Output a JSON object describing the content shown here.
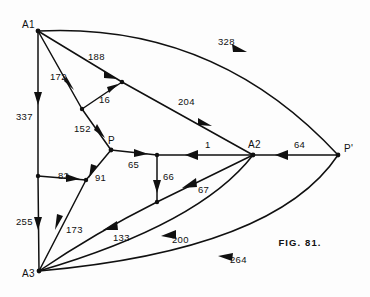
{
  "figure": {
    "caption": "FIG. 81.",
    "caption_x": 300,
    "caption_y": 246,
    "ink_color": "#101010",
    "background_color": "#fdfdfd"
  },
  "nodes": [
    {
      "id": "A1",
      "label": "A1",
      "x": 38,
      "y": 31,
      "label_x": 22,
      "label_y": 28,
      "terminal": true
    },
    {
      "id": "A2",
      "label": "A2",
      "x": 253,
      "y": 155,
      "label_x": 248,
      "label_y": 148,
      "terminal": true
    },
    {
      "id": "A3",
      "label": "A3",
      "x": 39,
      "y": 271,
      "label_x": 22,
      "label_y": 277,
      "terminal": true
    },
    {
      "id": "P",
      "label": "P",
      "x": 111,
      "y": 150,
      "label_x": 108,
      "label_y": 144,
      "terminal": true
    },
    {
      "id": "Pp",
      "label": "P'",
      "x": 338,
      "y": 155,
      "label_x": 344,
      "label_y": 152,
      "terminal": true
    },
    {
      "id": "J1",
      "label": "",
      "x": 122,
      "y": 82,
      "label_x": 0,
      "label_y": 0,
      "terminal": false
    },
    {
      "id": "J2",
      "label": "",
      "x": 82,
      "y": 109,
      "label_x": 0,
      "label_y": 0,
      "terminal": false
    },
    {
      "id": "J3",
      "label": "",
      "x": 38,
      "y": 176,
      "label_x": 0,
      "label_y": 0,
      "terminal": false
    },
    {
      "id": "J4",
      "label": "",
      "x": 86,
      "y": 180,
      "label_x": 0,
      "label_y": 0,
      "terminal": false
    },
    {
      "id": "J5",
      "label": "",
      "x": 157,
      "y": 155,
      "label_x": 0,
      "label_y": 0,
      "terminal": false
    },
    {
      "id": "J6",
      "label": "",
      "x": 157,
      "y": 202,
      "label_x": 0,
      "label_y": 0,
      "terminal": false
    }
  ],
  "edges": [
    {
      "id": "e-188",
      "label": "188",
      "from": "A1",
      "to": "J1",
      "label_x": 88,
      "label_y": 60,
      "shape": "straight"
    },
    {
      "id": "e-204",
      "label": "204",
      "from": "J1",
      "to": "A2",
      "label_x": 178,
      "label_y": 105,
      "shape": "straight"
    },
    {
      "id": "e-328",
      "label": "328",
      "from": "A1",
      "to": "Pp",
      "label_x": 218,
      "label_y": 45,
      "shape": "curve"
    },
    {
      "id": "e-172",
      "label": "172",
      "from": "A1",
      "to": "J2",
      "label_x": 50,
      "label_y": 80,
      "shape": "straight"
    },
    {
      "id": "e-16",
      "label": "16",
      "from": "J2",
      "to": "J1",
      "label_x": 99,
      "label_y": 103,
      "shape": "straight"
    },
    {
      "id": "e-152",
      "label": "152",
      "from": "J2",
      "to": "P",
      "label_x": 74,
      "label_y": 132,
      "shape": "straight"
    },
    {
      "id": "e-337",
      "label": "337",
      "from": "A1",
      "to": "J3",
      "label_x": 16,
      "label_y": 120,
      "shape": "straight"
    },
    {
      "id": "e-255",
      "label": "255",
      "from": "J3",
      "to": "A3",
      "label_x": 16,
      "label_y": 225,
      "shape": "straight"
    },
    {
      "id": "e-82",
      "label": "82",
      "from": "J3",
      "to": "J4",
      "label_x": 58,
      "label_y": 179,
      "shape": "straight"
    },
    {
      "id": "e-91",
      "label": "91",
      "from": "P",
      "to": "J4",
      "label_x": 95,
      "label_y": 181,
      "shape": "straight"
    },
    {
      "id": "e-173",
      "label": "173",
      "from": "J4",
      "to": "A3",
      "label_x": 66,
      "label_y": 233,
      "shape": "straight"
    },
    {
      "id": "e-65",
      "label": "65",
      "from": "P",
      "to": "J5",
      "label_x": 128,
      "label_y": 168,
      "shape": "straight"
    },
    {
      "id": "e-1",
      "label": "1",
      "from": "A2",
      "to": "J5",
      "label_x": 205,
      "label_y": 148,
      "shape": "straight"
    },
    {
      "id": "e-66",
      "label": "66",
      "from": "J5",
      "to": "J6",
      "label_x": 163,
      "label_y": 180,
      "shape": "straight"
    },
    {
      "id": "e-67",
      "label": "67",
      "from": "A2",
      "to": "J6",
      "label_x": 198,
      "label_y": 193,
      "shape": "straight"
    },
    {
      "id": "e-133",
      "label": "133",
      "from": "J6",
      "to": "A3",
      "label_x": 113,
      "label_y": 241,
      "shape": "curve"
    },
    {
      "id": "e-200",
      "label": "200",
      "from": "A2",
      "to": "A3",
      "label_x": 172,
      "label_y": 243,
      "shape": "curve"
    },
    {
      "id": "e-264",
      "label": "264",
      "from": "Pp",
      "to": "A3",
      "label_x": 230,
      "label_y": 263,
      "shape": "curve"
    },
    {
      "id": "e-64",
      "label": "64",
      "from": "Pp",
      "to": "A2",
      "label_x": 294,
      "label_y": 148,
      "shape": "straight"
    }
  ]
}
